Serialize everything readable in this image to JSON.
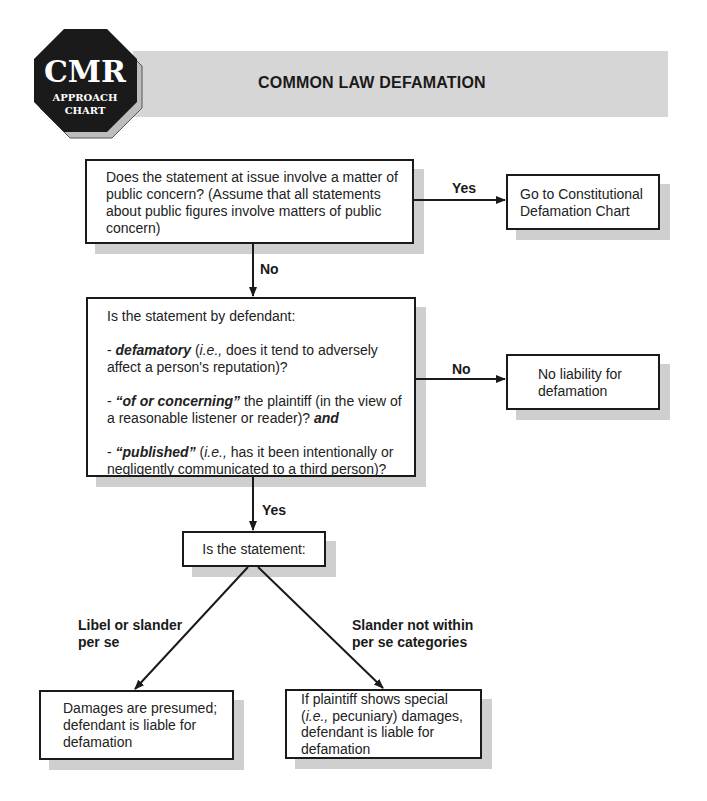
{
  "logo": {
    "line1": "CMR",
    "line2": "APPROACH",
    "line3": "CHART"
  },
  "header": {
    "title": "COMMON LAW DEFAMATION"
  },
  "nodes": {
    "q1": {
      "text": "Does the statement at issue involve a matter of public concern? (Assume that all statements about public figures involve matters of public concern)"
    },
    "go_constitutional": {
      "text": "Go to Constitutional Defamation Chart"
    },
    "q2": {
      "intro": "Is the statement by defendant:",
      "item1_prefix": "- ",
      "item1_term": "defamatory",
      "item1_open": " (",
      "item1_ie": "i.e.,",
      "item1_rest": " does it tend to adversely affect a person's reputation)?",
      "item2_prefix": "- ",
      "item2_term": "“of or concerning”",
      "item2_rest": " the plaintiff (in the view of a reasonable listener or reader)? ",
      "item2_and": "and",
      "item3_prefix": "- ",
      "item3_term": "“published”",
      "item3_open": " (",
      "item3_ie": "i.e.,",
      "item3_rest": " has it been intentionally or negligently communicated to a third person)?"
    },
    "no_liability": {
      "text": "No liability for defamation"
    },
    "q3": {
      "text": "Is the statement:"
    },
    "presumed": {
      "text": "Damages are presumed; defendant is liable for defamation"
    },
    "special": {
      "line1": "If plaintiff shows special",
      "ie": "i.e.,",
      "line2_rest": " pecuniary) damages,",
      "line3": "defendant is liable for defamation"
    }
  },
  "edges": {
    "q1_yes": "Yes",
    "q1_no": "No",
    "q2_no": "No",
    "q2_yes": "Yes",
    "q3_left": "Libel or slander per se",
    "q3_right": "Slander not within per se categories"
  },
  "colors": {
    "ink": "#1a1a1a",
    "shadow": "#cfcfcf",
    "header_bar": "#d6d6d6",
    "logo_fill": "#1a1a1a",
    "logo_shadow": "#bdbdbd"
  }
}
